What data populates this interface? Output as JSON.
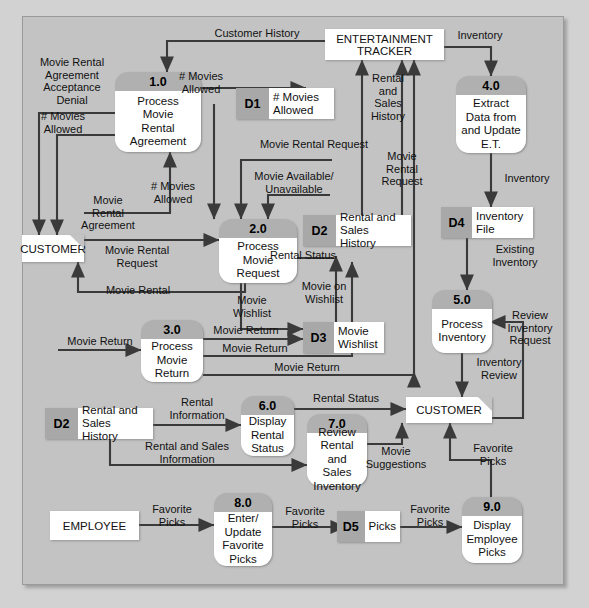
{
  "diagram": {
    "type": "data-flow-diagram",
    "colors": {
      "page_background": "#d2d2d2",
      "panel_background": "#c3c3c3",
      "process_header": "#b0b0b0",
      "process_body": "#ffffff",
      "store_id": "#a8a8a8",
      "store_name": "#ffffff",
      "entity": "#ffffff",
      "line": "#3a3a3a"
    }
  },
  "processes": [
    {
      "id": "1.0",
      "number": "1.0",
      "name": "Process\nMovie\nRental\nAgreement"
    },
    {
      "id": "2.0",
      "number": "2.0",
      "name": "Process\nMovie\nRequest"
    },
    {
      "id": "3.0",
      "number": "3.0",
      "name": "Process\nMovie\nReturn"
    },
    {
      "id": "4.0",
      "number": "4.0",
      "name": "Extract\nData from\nand Update\nE.T."
    },
    {
      "id": "5.0",
      "number": "5.0",
      "name": "Process\nInventory"
    },
    {
      "id": "6.0",
      "number": "6.0",
      "name": "Display\nRental\nStatus"
    },
    {
      "id": "7.0",
      "number": "7.0",
      "name": "Review\nRental and\nSales\nInventory"
    },
    {
      "id": "8.0",
      "number": "8.0",
      "name": "Enter/\nUpdate\nFavorite\nPicks"
    },
    {
      "id": "9.0",
      "number": "9.0",
      "name": "Display\nEmployee\nPicks"
    }
  ],
  "entities": [
    {
      "id": "et",
      "name": "ENTERTAINMENT\nTRACKER"
    },
    {
      "id": "customer-left",
      "name": "CUSTOMER"
    },
    {
      "id": "customer-right",
      "name": "CUSTOMER"
    },
    {
      "id": "employee",
      "name": "EMPLOYEE"
    }
  ],
  "stores": [
    {
      "id": "D1",
      "code": "D1",
      "name": "# Movies\nAllowed"
    },
    {
      "id": "D2a",
      "code": "D2",
      "name": "Rental and\nSales History"
    },
    {
      "id": "D3",
      "code": "D3",
      "name": "Movie\nWishlist"
    },
    {
      "id": "D4",
      "code": "D4",
      "name": "Inventory\nFile"
    },
    {
      "id": "D2b",
      "code": "D2",
      "name": "Rental and\nSales History"
    },
    {
      "id": "D5",
      "code": "D5",
      "name": "Picks"
    }
  ],
  "flows": [
    {
      "id": "f01",
      "label": "Customer History"
    },
    {
      "id": "f02",
      "label": "Movie Rental\nAgreement\nAcceptance\nDenial"
    },
    {
      "id": "f03",
      "label": "# Movies\nAllowed"
    },
    {
      "id": "f04",
      "label": "# Movies\nAllowed"
    },
    {
      "id": "f05",
      "label": "Movie\nRental\nAgreement"
    },
    {
      "id": "f06",
      "label": "# Movies\nAllowed"
    },
    {
      "id": "f07",
      "label": "Inventory"
    },
    {
      "id": "f08",
      "label": "Rental\nand\nSales\nHistory"
    },
    {
      "id": "f09",
      "label": "Movie Rental Request"
    },
    {
      "id": "f10",
      "label": "Movie Available/\nUnavailable"
    },
    {
      "id": "f11",
      "label": "Movie\nRental\nRequest"
    },
    {
      "id": "f12",
      "label": "Inventory"
    },
    {
      "id": "f13",
      "label": "Existing\nInventory"
    },
    {
      "id": "f14",
      "label": "Movie Rental\nRequest"
    },
    {
      "id": "f15",
      "label": "Movie Rental"
    },
    {
      "id": "f16",
      "label": "Rental Status"
    },
    {
      "id": "f17",
      "label": "Movie\nWishlist"
    },
    {
      "id": "f18",
      "label": "Movie on\nWishlist"
    },
    {
      "id": "f19",
      "label": "Movie Return"
    },
    {
      "id": "f20",
      "label": "Movie Return"
    },
    {
      "id": "f21",
      "label": "Movie Return"
    },
    {
      "id": "f22",
      "label": "Movie Return"
    },
    {
      "id": "f23",
      "label": "Review\nInventory\nRequest"
    },
    {
      "id": "f24",
      "label": "Inventory\nReview"
    },
    {
      "id": "f25",
      "label": "Rental\nInformation"
    },
    {
      "id": "f26",
      "label": "Rental Status"
    },
    {
      "id": "f27",
      "label": "Rental and Sales\nInformation"
    },
    {
      "id": "f28",
      "label": "Movie\nSuggestions"
    },
    {
      "id": "f29",
      "label": "Favorite\nPicks"
    },
    {
      "id": "f30",
      "label": "Favorite\nPicks"
    },
    {
      "id": "f31",
      "label": "Favorite\nPicks"
    },
    {
      "id": "f32",
      "label": "Favorite\nPicks"
    },
    {
      "id": "f33",
      "label": "Favorite\nPicks"
    }
  ]
}
